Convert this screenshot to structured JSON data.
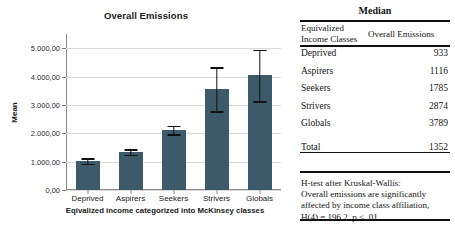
{
  "chart_data": {
    "type": "bar",
    "title": "Overall Emissions",
    "xlabel": "Eqivalized income categorized into McKinsey classes",
    "ylabel": "Mean",
    "categories": [
      "Deprived",
      "Aspirers",
      "Seekers",
      "Strivers",
      "Globals"
    ],
    "values": [
      1020,
      1350,
      2120,
      3560,
      4040
    ],
    "error_low": [
      920,
      1250,
      1960,
      2780,
      3130
    ],
    "error_high": [
      1120,
      1440,
      2270,
      4320,
      4950
    ],
    "ylim": [
      0,
      5500
    ],
    "yticks": [
      0,
      1000,
      2000,
      3000,
      4000,
      5000
    ],
    "ytick_labels": [
      "0,00",
      "1.000,00",
      "2.000,00",
      "3.000,00",
      "4.000,00",
      "5.000,00"
    ],
    "grid": true,
    "legend": "none",
    "bar_color": "#3d5a6b",
    "error_color": "#111111",
    "gridline_color": "#d9d9d9"
  },
  "table": {
    "caption": "Median",
    "columns": {
      "left_line1": "Equivalized",
      "left_line2": "Income Classes",
      "right": "Overall Emissions"
    },
    "rows": [
      {
        "label": "Deprived",
        "value": "933"
      },
      {
        "label": "Aspirers",
        "value": "1116"
      },
      {
        "label": "Seekers",
        "value": "1785"
      },
      {
        "label": "Strivers",
        "value": "2874"
      },
      {
        "label": "Globals",
        "value": "3789"
      }
    ],
    "total": {
      "label": "Total",
      "value": "1352"
    },
    "footnote": [
      "H-test after Kruskal-Wallis:",
      "Overall emissions are significantly",
      "affected by income class affiliation,",
      "H(4) = 196.2, p < .01."
    ]
  }
}
